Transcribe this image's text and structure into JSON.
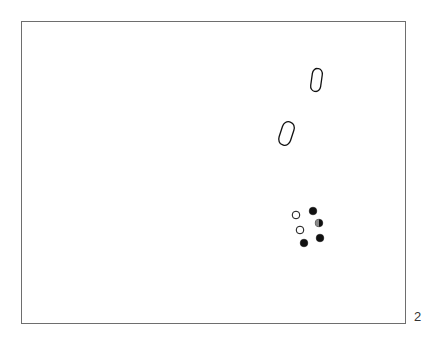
{
  "figure": {
    "number_label": "2",
    "frame": {
      "x": 21,
      "y": 21,
      "width": 385,
      "height": 303,
      "stroke": "#6e6e6e"
    }
  },
  "shapes": {
    "outlined_ovals": [
      {
        "cx": 316.5,
        "cy": 80,
        "rx": 5,
        "ry": 11.5,
        "rotate": 8
      },
      {
        "cx": 286.5,
        "cy": 133.5,
        "rx": 6,
        "ry": 12,
        "rotate": 18
      }
    ],
    "dots": [
      {
        "cx": 296,
        "cy": 215,
        "r": 3.8,
        "fill": "open"
      },
      {
        "cx": 313,
        "cy": 211,
        "r": 3.8,
        "fill": "filled"
      },
      {
        "cx": 300,
        "cy": 230,
        "r": 3.8,
        "fill": "open"
      },
      {
        "cx": 319,
        "cy": 223,
        "r": 3.8,
        "fill": "half"
      },
      {
        "cx": 304,
        "cy": 243,
        "r": 3.8,
        "fill": "filled"
      },
      {
        "cx": 320,
        "cy": 238,
        "r": 3.8,
        "fill": "filled"
      }
    ]
  },
  "colors": {
    "ink": "#111111",
    "frame": "#6e6e6e",
    "background": "#ffffff"
  }
}
